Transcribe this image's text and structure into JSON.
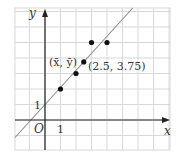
{
  "chart_data": {
    "type": "scatter",
    "title": "",
    "xlabel": "x",
    "ylabel": "y",
    "xlim": [
      -1.94,
      4.78
    ],
    "ylim": [
      -1.94,
      7.23
    ],
    "grid": true,
    "points": [
      {
        "x": 1,
        "y": 2
      },
      {
        "x": 2,
        "y": 3
      },
      {
        "x": 3,
        "y": 5
      },
      {
        "x": 4,
        "y": 5
      }
    ],
    "mean_point": {
      "x": 2.5,
      "y": 3.75,
      "label": "(2.5, 3.75)",
      "name_label": "(x̄, ȳ)"
    },
    "regression_line": {
      "slope": 1.1,
      "intercept": 1.0
    },
    "tick_labels": {
      "x": [
        "1"
      ],
      "y": [
        "1"
      ],
      "origin": "O"
    }
  },
  "labels": {
    "x_axis": "x",
    "y_axis": "y",
    "origin": "O",
    "x_tick_1": "1",
    "y_tick_1": "1",
    "mean_name": "(x̄, ȳ)",
    "mean_value": "(2.5, 3.75)"
  },
  "colors": {
    "grid": "#d8d8d8",
    "axis": "#222222",
    "line": "#8a8a8a",
    "point": "#111111"
  }
}
